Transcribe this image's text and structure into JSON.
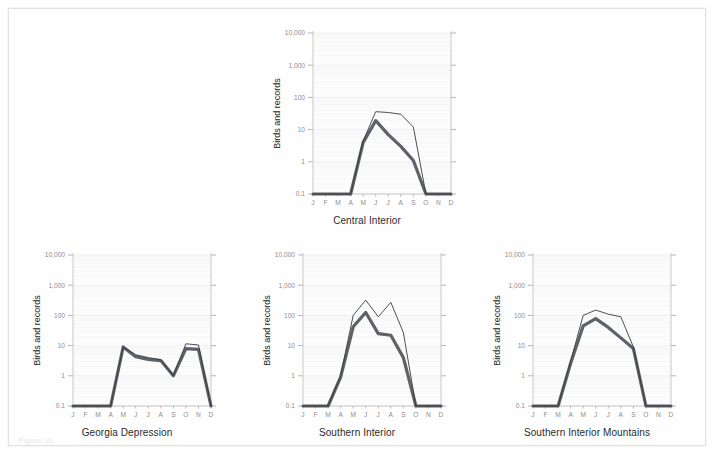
{
  "figure": {
    "caption_fragment": "Figure 10. ",
    "y_axis_label": "Birds and records",
    "months": [
      "J",
      "F",
      "M",
      "A",
      "M",
      "J",
      "J",
      "A",
      "S",
      "O",
      "N",
      "D"
    ],
    "y_ticks": [
      "10,000",
      "1,000",
      "100",
      "10",
      "1",
      "0.1"
    ],
    "colors": {
      "series_thick": "#5d6169",
      "series_thin": "#3b3b3b",
      "axis": "#c9c9c9",
      "grid": "#f4f4f4",
      "frame": "#e2e2e2",
      "background": "#ffffff"
    }
  },
  "chart_data": [
    {
      "type": "line",
      "title": "Central Interior",
      "xlabel": "",
      "ylabel": "Birds and records",
      "yscale": "log",
      "ylim": [
        0.1,
        10000
      ],
      "ytick_values": [
        0.1,
        1,
        10,
        100,
        1000,
        10000
      ],
      "ytick_labels": [
        "0.1",
        "1",
        "10",
        "100",
        "1,000",
        "10,000"
      ],
      "categories": [
        "J",
        "F",
        "M",
        "A",
        "M",
        "J",
        "J",
        "A",
        "S",
        "O",
        "N",
        "D"
      ],
      "grid": true,
      "legend": "none",
      "series": [
        {
          "name": "records",
          "style": "thin",
          "values": [
            0.1,
            0.1,
            0.1,
            0.1,
            4.5,
            36,
            34,
            30,
            12,
            0.1,
            0.1,
            0.1
          ]
        },
        {
          "name": "birds",
          "style": "thick",
          "values": [
            0.1,
            0.1,
            0.1,
            0.1,
            4.0,
            19,
            7.0,
            3.0,
            1.1,
            0.1,
            0.1,
            0.1
          ]
        }
      ]
    },
    {
      "type": "line",
      "title": "Georgia Depression",
      "xlabel": "",
      "ylabel": "Birds and records",
      "yscale": "log",
      "ylim": [
        0.1,
        10000
      ],
      "ytick_values": [
        0.1,
        1,
        10,
        100,
        1000,
        10000
      ],
      "ytick_labels": [
        "0.1",
        "1",
        "10",
        "100",
        "1,000",
        "10,000"
      ],
      "categories": [
        "J",
        "F",
        "M",
        "A",
        "M",
        "J",
        "J",
        "A",
        "S",
        "O",
        "N",
        "D"
      ],
      "grid": true,
      "legend": "none",
      "series": [
        {
          "name": "records",
          "style": "thin",
          "values": [
            0.1,
            0.1,
            0.1,
            0.1,
            9.0,
            5.0,
            4.0,
            3.4,
            1.0,
            11.5,
            10.5,
            0.1
          ]
        },
        {
          "name": "birds",
          "style": "thick",
          "values": [
            0.1,
            0.1,
            0.1,
            0.1,
            9.0,
            4.3,
            3.5,
            3.2,
            1.0,
            8.0,
            7.5,
            0.1
          ]
        }
      ]
    },
    {
      "type": "line",
      "title": "Southern Interior",
      "xlabel": "",
      "ylabel": "Birds and records",
      "yscale": "log",
      "ylim": [
        0.1,
        10000
      ],
      "ytick_values": [
        0.1,
        1,
        10,
        100,
        1000,
        10000
      ],
      "ytick_labels": [
        "0.1",
        "1",
        "10",
        "100",
        "1,000",
        "10,000"
      ],
      "categories": [
        "J",
        "F",
        "M",
        "A",
        "M",
        "J",
        "J",
        "A",
        "S",
        "O",
        "N",
        "D"
      ],
      "grid": true,
      "legend": "none",
      "series": [
        {
          "name": "records",
          "style": "thin",
          "values": [
            0.1,
            0.1,
            0.1,
            1.0,
            100,
            320,
            90,
            270,
            27,
            0.1,
            0.1,
            0.1
          ]
        },
        {
          "name": "birds",
          "style": "thick",
          "values": [
            0.1,
            0.1,
            0.1,
            0.9,
            42,
            125,
            25,
            22,
            4.0,
            0.1,
            0.1,
            0.1
          ]
        }
      ]
    },
    {
      "type": "line",
      "title": "Southern Interior Mountains",
      "xlabel": "",
      "ylabel": "Birds and records",
      "yscale": "log",
      "ylim": [
        0.1,
        10000
      ],
      "ytick_values": [
        0.1,
        1,
        10,
        100,
        1000,
        10000
      ],
      "ytick_labels": [
        "0.1",
        "1",
        "10",
        "100",
        "1,000",
        "10,000"
      ],
      "categories": [
        "J",
        "F",
        "M",
        "A",
        "M",
        "J",
        "J",
        "A",
        "S",
        "O",
        "N",
        "D"
      ],
      "grid": true,
      "legend": "none",
      "series": [
        {
          "name": "records",
          "style": "thin",
          "values": [
            0.1,
            0.1,
            0.1,
            3.0,
            100,
            150,
            110,
            90,
            9.0,
            0.1,
            0.1,
            0.1
          ]
        },
        {
          "name": "birds",
          "style": "thick",
          "values": [
            0.1,
            0.1,
            0.1,
            2.6,
            45,
            78,
            40,
            18,
            8.0,
            0.1,
            0.1,
            0.1
          ]
        }
      ]
    }
  ],
  "panels": [
    {
      "index": 0,
      "left": 258,
      "top": 18,
      "width": 200,
      "height": 185,
      "title_top": 206
    },
    {
      "index": 1,
      "left": 18,
      "top": 240,
      "width": 200,
      "height": 175,
      "title_top": 418
    },
    {
      "index": 2,
      "left": 248,
      "top": 240,
      "width": 200,
      "height": 175,
      "title_top": 418
    },
    {
      "index": 3,
      "left": 478,
      "top": 240,
      "width": 200,
      "height": 175,
      "title_top": 418
    }
  ]
}
